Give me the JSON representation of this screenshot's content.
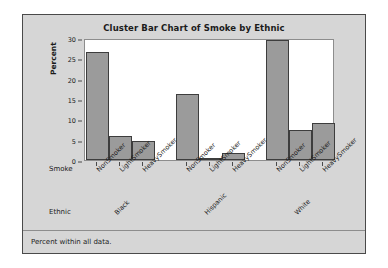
{
  "chart_data": {
    "type": "bar",
    "title": "Cluster Bar Chart of Smoke by Ethnic",
    "xlabel": "Smoke",
    "ylabel": "Percent",
    "ylim": [
      0,
      30
    ],
    "yticks": [
      0,
      5,
      10,
      15,
      20,
      25,
      30
    ],
    "grid": false,
    "legend": null,
    "group_axis_label": "Ethnic",
    "categories": [
      "NonSmoker",
      "LightSmoker",
      "HeavySmoker"
    ],
    "groups": [
      "Black",
      "Hispanic",
      "White"
    ],
    "footnote": "Percent within all data.",
    "bars": [
      {
        "group": "Black",
        "category": "NonSmoker",
        "value": 26.5
      },
      {
        "group": "Black",
        "category": "LightSmoker",
        "value": 6.0
      },
      {
        "group": "Black",
        "category": "HeavySmoker",
        "value": 4.6
      },
      {
        "group": "Hispanic",
        "category": "NonSmoker",
        "value": 16.2
      },
      {
        "group": "Hispanic",
        "category": "LightSmoker",
        "value": 0.2
      },
      {
        "group": "Hispanic",
        "category": "HeavySmoker",
        "value": 1.7
      },
      {
        "group": "White",
        "category": "NonSmoker",
        "value": 29.6
      },
      {
        "group": "White",
        "category": "LightSmoker",
        "value": 7.5
      },
      {
        "group": "White",
        "category": "HeavySmoker",
        "value": 9.0
      }
    ],
    "colors": {
      "bar_fill": "#9b9b9b",
      "bar_border": "#3d3d3d",
      "panel_background": "#d6d6d6",
      "plot_background": "#ffffff",
      "text": "#1b1b1b"
    }
  }
}
